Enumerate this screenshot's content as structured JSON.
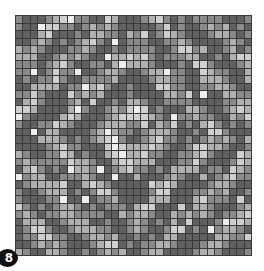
{
  "figure": {
    "label": "8",
    "grid": {
      "rows": 32,
      "cols": 32,
      "pattern": "concentric-diamonds",
      "band_period": 7,
      "dark_band_centers": [
        0,
        8,
        15,
        22,
        29
      ],
      "noise_seed": 8
    },
    "palette": [
      "#eeeeee",
      "#cfcfcf",
      "#b0b0b0",
      "#8a8a8a",
      "#606060"
    ],
    "border_color": "#3a3a3a"
  }
}
